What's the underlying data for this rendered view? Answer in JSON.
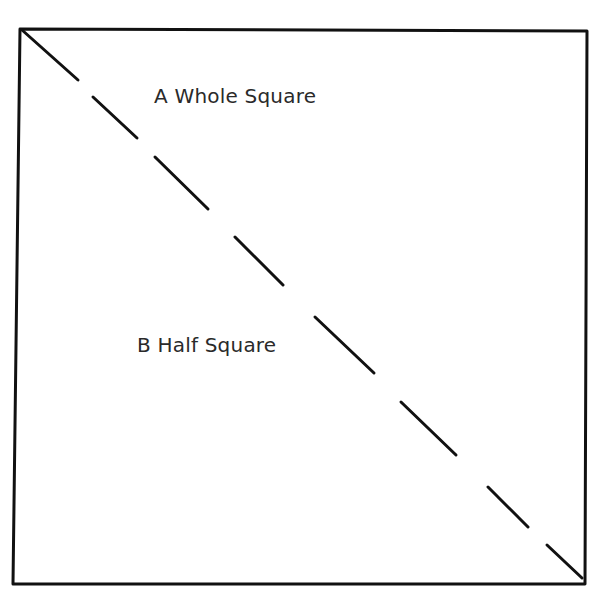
{
  "diagram": {
    "labels": {
      "whole": "A Whole Square",
      "half": "B Half Square"
    },
    "colors": {
      "line": "#111111",
      "text": "#2a2a2a",
      "background": "#ffffff"
    },
    "square": {
      "top_left": [
        20,
        29
      ],
      "top_right": [
        587,
        31
      ],
      "bottom_right": [
        585,
        584
      ],
      "bottom_left": [
        13,
        584
      ]
    },
    "diagonal_dashes": [
      [
        22,
        30,
        78,
        80
      ],
      [
        93,
        97,
        137,
        138
      ],
      [
        155,
        157,
        208,
        209
      ],
      [
        235,
        237,
        283,
        285
      ],
      [
        315,
        317,
        374,
        373
      ],
      [
        401,
        402,
        456,
        455
      ],
      [
        488,
        487,
        528,
        527
      ],
      [
        547,
        545,
        582,
        578
      ]
    ]
  }
}
